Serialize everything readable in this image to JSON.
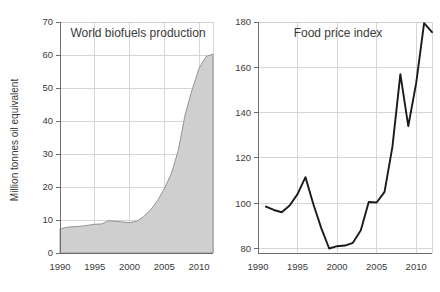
{
  "figure": {
    "background": "#ffffff",
    "width": 440,
    "height": 292
  },
  "chart_data": [
    {
      "id": "biofuels",
      "type": "area",
      "title": "World biofuels production",
      "xlabel": "",
      "ylabel": "Million tonnes oil equivalent",
      "xlim": [
        1990,
        2012
      ],
      "ylim": [
        0,
        70
      ],
      "xticks": [
        1990,
        1995,
        2000,
        2005,
        2010
      ],
      "xtick_labels": [
        "1990",
        "1995",
        "2000",
        "2005",
        "2010"
      ],
      "yticks": [
        0,
        10,
        20,
        30,
        40,
        50,
        60,
        70
      ],
      "ytick_labels": [
        "0",
        "10",
        "20",
        "30",
        "40",
        "50",
        "60",
        "70"
      ],
      "grid": true,
      "fill_color": "#cfcfcf",
      "line_color": "#8a8a8a",
      "x": [
        1990,
        1991,
        1992,
        1993,
        1994,
        1995,
        1996,
        1997,
        1998,
        1999,
        2000,
        2001,
        2002,
        2003,
        2004,
        2005,
        2006,
        2007,
        2008,
        2009,
        2010,
        2011,
        2012
      ],
      "values": [
        7.3,
        7.8,
        8.0,
        8.1,
        8.4,
        8.7,
        8.8,
        9.8,
        9.6,
        9.4,
        9.2,
        9.6,
        11.0,
        13.0,
        15.8,
        19.5,
        24.0,
        31.0,
        42.0,
        49.5,
        56.0,
        59.5,
        60.3
      ]
    },
    {
      "id": "foodprice",
      "type": "line",
      "title": "Food price index",
      "xlabel": "",
      "ylabel": "",
      "xlim": [
        1990,
        2012
      ],
      "ylim": [
        78,
        180
      ],
      "xticks": [
        1990,
        1995,
        2000,
        2005,
        2010
      ],
      "xtick_labels": [
        "1990",
        "1995",
        "2000",
        "2005",
        "2010"
      ],
      "yticks": [
        80,
        100,
        120,
        140,
        160,
        180
      ],
      "ytick_labels": [
        "80",
        "100",
        "120",
        "140",
        "160",
        "180"
      ],
      "grid": true,
      "line_color": "#1a1a1a",
      "x": [
        1991,
        1992,
        1993,
        1994,
        1995,
        1996,
        1997,
        1998,
        1999,
        2000,
        2001,
        2002,
        2003,
        2004,
        2005,
        2006,
        2007,
        2008,
        2009,
        2010,
        2011,
        2012
      ],
      "values": [
        98.5,
        97.0,
        96.0,
        99.0,
        104.0,
        111.5,
        99.5,
        89.0,
        80.0,
        81.0,
        81.3,
        82.5,
        88.0,
        100.5,
        100.3,
        105.0,
        125.0,
        157.0,
        134.0,
        153.0,
        179.5,
        175.5
      ]
    }
  ]
}
